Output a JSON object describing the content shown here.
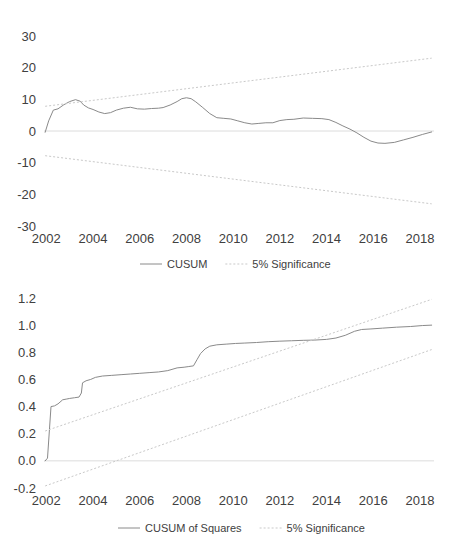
{
  "page": {
    "title_fragment": "",
    "background": "#ffffff",
    "line_color": "#8a8a8a",
    "band_color": "#c9c9c9",
    "text_color": "#404040"
  },
  "chart_data": [
    {
      "id": "cusum",
      "type": "line",
      "title": "",
      "xlabel": "",
      "ylabel": "",
      "xlim": [
        2001.9,
        2018.6
      ],
      "ylim": [
        -30,
        30
      ],
      "grid": false,
      "zero_line": true,
      "xticks": [
        2002,
        2004,
        2006,
        2008,
        2010,
        2012,
        2014,
        2016,
        2018
      ],
      "xtick_labels": [
        "2002",
        "2004",
        "2006",
        "2008",
        "2010",
        "2012",
        "2014",
        "2016",
        "2018"
      ],
      "yticks": [
        -30,
        -20,
        -10,
        0,
        10,
        20,
        30
      ],
      "ytick_labels": [
        "-30",
        "-20",
        "-10",
        "0",
        "10",
        "20",
        "30"
      ],
      "legend_position": "bottom",
      "series": [
        {
          "name": "CUSUM",
          "style": "solid",
          "color": "#8a8a8a",
          "x": [
            2001.95,
            2002.1,
            2002.3,
            2002.5,
            2002.75,
            2003.0,
            2003.25,
            2003.45,
            2003.6,
            2003.8,
            2004.0,
            2004.25,
            2004.5,
            2004.75,
            2005.0,
            2005.3,
            2005.6,
            2005.9,
            2006.2,
            2006.5,
            2006.8,
            2007.0,
            2007.3,
            2007.6,
            2007.8,
            2008.0,
            2008.2,
            2008.4,
            2008.7,
            2009.0,
            2009.3,
            2009.6,
            2009.9,
            2010.2,
            2010.5,
            2010.8,
            2011.1,
            2011.4,
            2011.7,
            2012.0,
            2012.3,
            2012.6,
            2013.0,
            2013.4,
            2013.8,
            2014.1,
            2014.4,
            2014.7,
            2015.0,
            2015.3,
            2015.6,
            2015.9,
            2016.2,
            2016.5,
            2016.9,
            2017.3,
            2017.7,
            2018.1,
            2018.5
          ],
          "y": [
            -0.4,
            3.2,
            6.6,
            7.0,
            8.3,
            9.3,
            9.9,
            9.4,
            8.2,
            7.3,
            6.8,
            6.0,
            5.5,
            5.8,
            6.6,
            7.2,
            7.5,
            7.0,
            6.9,
            7.1,
            7.2,
            7.4,
            8.2,
            9.3,
            10.2,
            10.5,
            10.2,
            9.2,
            7.4,
            5.5,
            4.2,
            4.0,
            3.8,
            3.2,
            2.6,
            2.2,
            2.4,
            2.6,
            2.6,
            3.3,
            3.6,
            3.7,
            4.1,
            4.0,
            3.9,
            3.6,
            2.7,
            1.6,
            0.6,
            -0.6,
            -2.0,
            -3.2,
            -3.8,
            -3.9,
            -3.6,
            -2.8,
            -2.0,
            -1.1,
            -0.3
          ]
        },
        {
          "name": "5% Significance",
          "style": "dashed",
          "color": "#c9c9c9",
          "x": [
            2001.95,
            2018.5
          ],
          "y": [
            7.8,
            23.0
          ]
        },
        {
          "name": "5% Significance Lower",
          "style": "dashed",
          "color": "#c9c9c9",
          "x": [
            2001.95,
            2018.5
          ],
          "y": [
            -7.8,
            -23.0
          ]
        }
      ],
      "legend": [
        {
          "label": "CUSUM",
          "style": "solid"
        },
        {
          "label": "5% Significance",
          "style": "dashed"
        }
      ]
    },
    {
      "id": "cusum-of-squares",
      "type": "line",
      "title": "",
      "xlabel": "",
      "ylabel": "",
      "xlim": [
        2001.9,
        2018.6
      ],
      "ylim": [
        -0.2,
        1.2
      ],
      "grid": false,
      "zero_line": true,
      "xticks": [
        2002,
        2004,
        2006,
        2008,
        2010,
        2012,
        2014,
        2016,
        2018
      ],
      "xtick_labels": [
        "2002",
        "2004",
        "2006",
        "2008",
        "2010",
        "2012",
        "2014",
        "2016",
        "2018"
      ],
      "yticks": [
        -0.2,
        0.0,
        0.2,
        0.4,
        0.6,
        0.8,
        1.0,
        1.2
      ],
      "ytick_labels": [
        "-0.2",
        "0.0",
        "0.2",
        "0.4",
        "0.6",
        "0.8",
        "1.0",
        "1.2"
      ],
      "legend_position": "bottom",
      "series": [
        {
          "name": "CUSUM of Squares",
          "style": "solid",
          "color": "#8a8a8a",
          "x": [
            2001.95,
            2002.05,
            2002.2,
            2002.35,
            2002.5,
            2002.7,
            2002.85,
            2003.0,
            2003.2,
            2003.4,
            2003.5,
            2003.55,
            2003.7,
            2003.9,
            2004.1,
            2004.4,
            2004.8,
            2005.2,
            2005.6,
            2006.0,
            2006.4,
            2006.8,
            2007.2,
            2007.6,
            2007.9,
            2008.1,
            2008.3,
            2008.45,
            2008.6,
            2008.8,
            2009.0,
            2009.3,
            2009.7,
            2010.1,
            2010.5,
            2011.0,
            2011.5,
            2012.0,
            2012.5,
            2013.0,
            2013.5,
            2014.0,
            2014.4,
            2014.8,
            2015.2,
            2015.5,
            2015.9,
            2016.4,
            2017.0,
            2017.6,
            2018.1,
            2018.5
          ],
          "y": [
            0.0,
            0.02,
            0.4,
            0.405,
            0.42,
            0.45,
            0.455,
            0.46,
            0.465,
            0.47,
            0.5,
            0.575,
            0.59,
            0.6,
            0.615,
            0.625,
            0.63,
            0.635,
            0.64,
            0.645,
            0.65,
            0.655,
            0.665,
            0.685,
            0.69,
            0.695,
            0.7,
            0.745,
            0.79,
            0.825,
            0.845,
            0.855,
            0.86,
            0.865,
            0.868,
            0.872,
            0.878,
            0.882,
            0.885,
            0.888,
            0.89,
            0.895,
            0.905,
            0.925,
            0.955,
            0.968,
            0.972,
            0.978,
            0.985,
            0.99,
            0.997,
            1.0
          ]
        },
        {
          "name": "5% Significance Upper",
          "style": "dashed",
          "color": "#c9c9c9",
          "x": [
            2001.95,
            2018.5
          ],
          "y": [
            0.22,
            1.19
          ]
        },
        {
          "name": "5% Significance Lower",
          "style": "dashed",
          "color": "#c9c9c9",
          "x": [
            2001.95,
            2018.5
          ],
          "y": [
            -0.185,
            0.82
          ]
        }
      ],
      "legend": [
        {
          "label": "CUSUM of Squares",
          "style": "solid"
        },
        {
          "label": "5% Significance",
          "style": "dashed"
        }
      ]
    }
  ]
}
